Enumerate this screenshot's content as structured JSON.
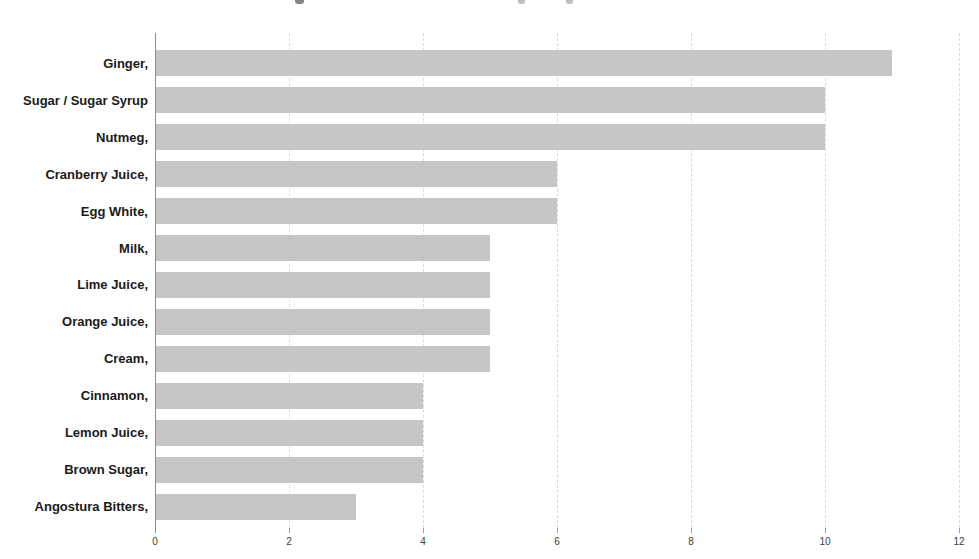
{
  "chart_data": {
    "type": "bar",
    "orientation": "horizontal",
    "title": "",
    "xlabel": "",
    "ylabel": "",
    "categories": [
      "Ginger,",
      "Sugar / Sugar Syrup",
      "Nutmeg,",
      "Cranberry Juice,",
      "Egg White,",
      "Milk,",
      "Lime Juice,",
      "Orange Juice,",
      "Cream,",
      "Cinnamon,",
      "Lemon Juice,",
      "Brown Sugar,",
      "Angostura Bitters,"
    ],
    "values": [
      11,
      10,
      10,
      6,
      6,
      5,
      5,
      5,
      5,
      4,
      4,
      4,
      3
    ],
    "xlim": [
      0,
      12
    ],
    "xticks": [
      0,
      2,
      4,
      6,
      8,
      10,
      12
    ],
    "grid": "vertical-dashed",
    "legend": "none",
    "colors": {
      "bar": "#c6c6c6",
      "axis_line": "#8c8c8c",
      "gridline": "#dadada",
      "category_label": "#1a1a1a",
      "tick_label": "#3e3e3e",
      "background": "#ffffff"
    }
  }
}
